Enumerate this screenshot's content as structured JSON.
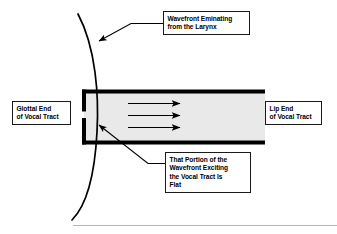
{
  "figure": {
    "background_color": "#ffffff",
    "width": 337,
    "height": 234
  },
  "callouts": {
    "wavefront_origin": "Wavefront Eminating\nfrom the Larynx",
    "glottal_end": "Glottal End\nof Vocal Tract",
    "lip_end": "Lip End\nof Vocal Tract",
    "flat_wavefront": "That Portion of the\nWavefront Exciting\nthe Vocal Tract Is\nFlat"
  },
  "diagram": {
    "tube": {
      "label": "vocal-tract-tube",
      "fill_color": "#e9e9e9",
      "wall_color": "#000000",
      "left": 82,
      "right": 265,
      "top": 90,
      "bottom": 144,
      "wall_thickness": 4,
      "glottis_gap": "open slit in left wall"
    },
    "wavefront_curve": {
      "label": "spherical-wavefront-arc",
      "color": "#000000",
      "description": "Curved arc bowing rightward, crossing the tube near the glottal end"
    },
    "flow_arrows": {
      "label": "plane-wave-flow-arrows",
      "count": 3,
      "direction": "right",
      "color": "#000000"
    },
    "leader_lines": {
      "wavefront_origin": "from callout down-left to the arc",
      "flat_wavefront": "from callout up-left into the tube"
    },
    "baseline_rule": {
      "label": "bottom-rule",
      "color": "#b4b4b4"
    }
  }
}
